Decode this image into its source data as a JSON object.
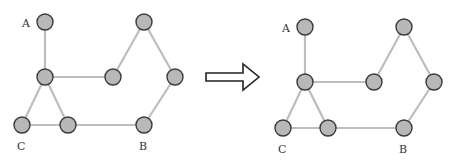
{
  "diagram": {
    "colors": {
      "node_fill": "#b8b8b8",
      "node_stroke": "#3a3a3a",
      "edge": "#bdbdbd",
      "arrow_stroke": "#222222"
    },
    "left_graph": {
      "nodes": [
        {
          "id": "A",
          "x": 45,
          "y": 22,
          "label": "A"
        },
        {
          "id": "M",
          "x": 45,
          "y": 77,
          "label": ""
        },
        {
          "id": "N",
          "x": 113,
          "y": 77,
          "label": ""
        },
        {
          "id": "T",
          "x": 144,
          "y": 22,
          "label": ""
        },
        {
          "id": "R",
          "x": 175,
          "y": 77,
          "label": ""
        },
        {
          "id": "B",
          "x": 144,
          "y": 125,
          "label": "B"
        },
        {
          "id": "C",
          "x": 22,
          "y": 125,
          "label": "C"
        },
        {
          "id": "D",
          "x": 68,
          "y": 125,
          "label": ""
        }
      ],
      "labels": [
        {
          "text": "A",
          "x": 22,
          "y": 27
        },
        {
          "text": "C",
          "x": 17,
          "y": 150
        },
        {
          "text": "B",
          "x": 139,
          "y": 150
        }
      ]
    },
    "right_graph": {
      "nodes": [
        {
          "id": "A",
          "x": 305,
          "y": 27,
          "label": "A"
        },
        {
          "id": "M",
          "x": 305,
          "y": 82,
          "label": ""
        },
        {
          "id": "N",
          "x": 374,
          "y": 82,
          "label": ""
        },
        {
          "id": "T",
          "x": 404,
          "y": 27,
          "label": ""
        },
        {
          "id": "R",
          "x": 434,
          "y": 82,
          "label": ""
        },
        {
          "id": "B",
          "x": 404,
          "y": 128,
          "label": "B"
        },
        {
          "id": "C",
          "x": 283,
          "y": 128,
          "label": "C"
        },
        {
          "id": "D",
          "x": 328,
          "y": 128,
          "label": ""
        }
      ],
      "labels": [
        {
          "text": "A",
          "x": 282,
          "y": 32
        },
        {
          "text": "C",
          "x": 278,
          "y": 153
        },
        {
          "text": "B",
          "x": 399,
          "y": 153
        }
      ]
    },
    "edges": [
      [
        "A",
        "M"
      ],
      [
        "M",
        "N"
      ],
      [
        "N",
        "T"
      ],
      [
        "T",
        "R"
      ],
      [
        "R",
        "B"
      ],
      [
        "B",
        "D"
      ],
      [
        "D",
        "C"
      ],
      [
        "C",
        "M"
      ],
      [
        "M",
        "D"
      ]
    ],
    "arrow": {
      "direction": "right",
      "points": "206,73 243,73 243,64 259,77 243,90 243,81 206,81"
    }
  }
}
